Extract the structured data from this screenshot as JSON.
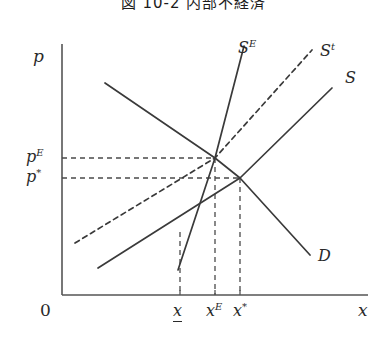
{
  "figure": {
    "title": "図 10-2  内部不経済",
    "width": 387,
    "height": 344,
    "line_color": "#3a3a3a",
    "axis_color": "#555555",
    "dash_color": "#4a4a4a"
  },
  "axes": {
    "y_label": "p",
    "x_label": "x",
    "origin_label": "0",
    "y_axis": {
      "x": 62,
      "y_top": 44,
      "y_bottom": 295
    },
    "x_axis": {
      "y": 295,
      "x_left": 62,
      "x_right": 368
    }
  },
  "price_ticks": [
    {
      "name": "p-E",
      "label_base": "p",
      "label_sup": "E",
      "value_y": 158,
      "label_x": 26,
      "label_y": 149
    },
    {
      "name": "p-star",
      "label_base": "p",
      "label_sup": "*",
      "value_y": 178,
      "label_x": 26,
      "label_y": 169
    }
  ],
  "quantity_ticks": [
    {
      "name": "x-underbar",
      "label_base": "x",
      "label_sup": "",
      "underlined": true,
      "value_x": 180,
      "label_x": 173,
      "label_y": 303
    },
    {
      "name": "x-E",
      "label_base": "x",
      "label_sup": "E",
      "underlined": false,
      "value_x": 215,
      "label_x": 206,
      "label_y": 303
    },
    {
      "name": "x-star",
      "label_base": "x",
      "label_sup": "*",
      "underlined": false,
      "value_x": 240,
      "label_x": 233,
      "label_y": 303
    }
  ],
  "curves": [
    {
      "name": "supply-social",
      "label": "S",
      "label_sup": "E",
      "style": "solid",
      "label_x": 238,
      "label_y": 40,
      "points": "178,270 215,158 244,46"
    },
    {
      "name": "supply-tax",
      "label": "S",
      "label_sup": "t",
      "style": "dashed",
      "label_x": 320,
      "label_y": 43,
      "points": "75,243 215,158 312,50"
    },
    {
      "name": "supply-private",
      "label": "S",
      "label_sup": "",
      "style": "solid",
      "label_x": 345,
      "label_y": 70,
      "points": "98,268 240,178 332,88"
    },
    {
      "name": "demand",
      "label": "D",
      "label_sup": "",
      "style": "solid",
      "label_x": 318,
      "label_y": 248,
      "points": "105,83 215,158 240,178 310,255"
    }
  ],
  "guide_lines": [
    {
      "name": "guide-h-pE",
      "orientation": "horizontal",
      "from_x": 62,
      "to_x": 215,
      "y": 158
    },
    {
      "name": "guide-h-pstar",
      "orientation": "horizontal",
      "from_x": 62,
      "to_x": 240,
      "y": 178
    },
    {
      "name": "guide-v-xunderbar",
      "orientation": "vertical",
      "x": 180,
      "from_y": 232,
      "to_y": 295
    },
    {
      "name": "guide-v-xE",
      "orientation": "vertical",
      "x": 215,
      "from_y": 158,
      "to_y": 295
    },
    {
      "name": "guide-v-xstar",
      "orientation": "vertical",
      "x": 240,
      "from_y": 178,
      "to_y": 295
    }
  ],
  "equilibria": [
    {
      "name": "equilibrium-social",
      "x": 215,
      "y": 158
    },
    {
      "name": "equilibrium-private",
      "x": 240,
      "y": 178
    }
  ]
}
